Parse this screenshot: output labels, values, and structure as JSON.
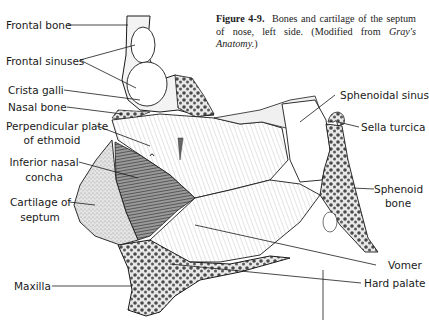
{
  "figure": {
    "number": "Figure 4-9.",
    "caption": "Bones and cartilage of the septum of nose, left side. (Modified from",
    "source": "Gray's Anatomy.",
    "source_suffix": ")"
  },
  "labels": {
    "frontal_bone": "Frontal bone",
    "frontal_sinuses": "Frontal sinuses",
    "crista_galli": "Crista galli",
    "nasal_bone": "Nasal bone",
    "perpendicular_plate_1": "Perpendicular plate",
    "perpendicular_plate_2": "of ethmoid",
    "inferior_nasal_1": "Inferior  nasal",
    "inferior_nasal_2": "concha",
    "cartilage_1": "Cartilage of",
    "cartilage_2": "septum",
    "maxilla": "Maxilla",
    "sphenoidal_sinus": "Sphenoidal sinus",
    "sella_turcica": "Sella turcica",
    "sphenoid_bone_1": "Sphenoid",
    "sphenoid_bone_2": "bone",
    "vomer": "Vomer",
    "hard_palate": "Hard palate"
  },
  "colors": {
    "ink": "#1a1a1a",
    "bone_fill": "#f4f4f4",
    "spongy": "#6a6a6a",
    "cartilage": "#d8d8d8",
    "concha": "#555555"
  }
}
